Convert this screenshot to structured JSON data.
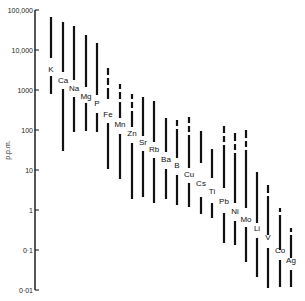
{
  "chart_data": {
    "type": "range-bar",
    "title": "",
    "xlabel": "",
    "ylabel": "p.p.m.",
    "yscale": "log",
    "ylim": [
      0.01,
      100000
    ],
    "yticks": [
      {
        "value": 100000,
        "label": "100,000"
      },
      {
        "value": 10000,
        "label": "10,000"
      },
      {
        "value": 1000,
        "label": "1000"
      },
      {
        "value": 100,
        "label": "100"
      },
      {
        "value": 10,
        "label": "10"
      },
      {
        "value": 1,
        "label": "1"
      },
      {
        "value": 0.1,
        "label": "0·1"
      },
      {
        "value": 0.01,
        "label": "0·01"
      }
    ],
    "grid": false,
    "legend": null,
    "categories": [
      "K",
      "Ca",
      "Na",
      "Mg",
      "P",
      "Fe",
      "Mn",
      "Zn",
      "Sr",
      "Rb",
      "Ba",
      "B",
      "Cu",
      "Cs",
      "Ti",
      "Pb",
      "Ni",
      "Mo",
      "Li",
      "V",
      "Co",
      "Ag"
    ],
    "series": [
      {
        "name": "K",
        "x": 51,
        "min": 700,
        "max": 60000,
        "label_y": 72,
        "segments": [
          [
            17,
            58
          ],
          [
            76,
            94
          ]
        ]
      },
      {
        "name": "Ca",
        "x": 63,
        "min": 30,
        "max": 50000,
        "label_y": 83,
        "segments": [
          [
            22,
            72
          ],
          [
            89,
            151
          ]
        ]
      },
      {
        "name": "Na",
        "x": 74,
        "min": 80,
        "max": 35000,
        "label_y": 91,
        "segments": [
          [
            26,
            80
          ],
          [
            97,
            132
          ]
        ]
      },
      {
        "name": "Mg",
        "x": 86,
        "min": 90,
        "max": 20000,
        "label_y": 99,
        "segments": [
          [
            35,
            87
          ],
          [
            103,
            131
          ]
        ]
      },
      {
        "name": "P",
        "x": 97,
        "min": 80,
        "max": 12000,
        "label_y": 106,
        "segments": [
          [
            43,
            95
          ],
          [
            113,
            132
          ]
        ]
      },
      {
        "name": "Fe",
        "x": 108,
        "min": 10,
        "max": 3000,
        "label_y": 117,
        "segments": [
          [
            68,
            75
          ],
          [
            78,
            85
          ],
          [
            88,
            99
          ],
          [
            123,
            169
          ]
        ]
      },
      {
        "name": "Mn",
        "x": 120,
        "min": 5,
        "max": 1500,
        "label_y": 127,
        "segments": [
          [
            84,
            89
          ],
          [
            92,
            99
          ],
          [
            102,
            118
          ],
          [
            134,
            179
          ]
        ]
      },
      {
        "name": "Zn",
        "x": 132,
        "min": 2,
        "max": 800,
        "label_y": 136,
        "segments": [
          [
            94,
            99
          ],
          [
            102,
            108
          ],
          [
            111,
            127
          ],
          [
            143,
            199
          ]
        ]
      },
      {
        "name": "Sr",
        "x": 143,
        "min": 2,
        "max": 600,
        "label_y": 145,
        "segments": [
          [
            97,
            136
          ],
          [
            151,
            197
          ]
        ]
      },
      {
        "name": "Rb",
        "x": 154,
        "min": 1,
        "max": 500,
        "label_y": 152,
        "segments": [
          [
            101,
            142
          ],
          [
            158,
            203
          ]
        ]
      },
      {
        "name": "Ba",
        "x": 166,
        "min": 2,
        "max": 250,
        "label_y": 162,
        "segments": [
          [
            118,
            152
          ],
          [
            169,
            199
          ]
        ]
      },
      {
        "name": "B",
        "x": 177,
        "min": 1,
        "max": 180,
        "label_y": 168,
        "segments": [
          [
            120,
            126
          ],
          [
            129,
            158
          ],
          [
            175,
            205
          ]
        ]
      },
      {
        "name": "Cu",
        "x": 189,
        "min": 1,
        "max": 150,
        "label_y": 177,
        "segments": [
          [
            117,
            123
          ],
          [
            126,
            132
          ],
          [
            135,
            168
          ],
          [
            183,
            207
          ]
        ]
      },
      {
        "name": "Cs",
        "x": 201,
        "min": 0.7,
        "max": 120,
        "label_y": 186,
        "segments": [
          [
            131,
            163
          ],
          [
            197,
            214
          ]
        ]
      },
      {
        "name": "Ti",
        "x": 212,
        "min": 0.6,
        "max": 60,
        "label_y": 194,
        "segments": [
          [
            149,
            178
          ],
          [
            203,
            218
          ]
        ]
      },
      {
        "name": "Pb",
        "x": 224,
        "min": 0.15,
        "max": 100,
        "label_y": 204,
        "segments": [
          [
            126,
            133
          ],
          [
            136,
            142
          ],
          [
            145,
            188
          ],
          [
            213,
            243
          ]
        ]
      },
      {
        "name": "Ni",
        "x": 235,
        "min": 0.1,
        "max": 100,
        "label_y": 214,
        "segments": [
          [
            133,
            141
          ],
          [
            144,
            150
          ],
          [
            153,
            203
          ],
          [
            221,
            245
          ]
        ]
      },
      {
        "name": "Mo",
        "x": 246,
        "min": 0.02,
        "max": 100,
        "label_y": 222,
        "segments": [
          [
            130,
            138
          ],
          [
            141,
            147
          ],
          [
            150,
            208
          ],
          [
            227,
            262
          ]
        ]
      },
      {
        "name": "Li",
        "x": 257,
        "min": 0.02,
        "max": 20,
        "label_y": 231,
        "segments": [
          [
            172,
            223
          ],
          [
            238,
            277
          ]
        ]
      },
      {
        "name": "V",
        "x": 268,
        "min": 0.01,
        "max": 10,
        "label_y": 240,
        "segments": [
          [
            185,
            193
          ],
          [
            196,
            235
          ],
          [
            248,
            288
          ]
        ]
      },
      {
        "name": "Co",
        "x": 280,
        "min": 0.01,
        "max": 5,
        "label_y": 253,
        "segments": [
          [
            208,
            212
          ],
          [
            215,
            250
          ],
          [
            260,
            287
          ]
        ]
      },
      {
        "name": "Ag",
        "x": 291,
        "min": 0.01,
        "max": 3,
        "label_y": 263,
        "segments": [
          [
            228,
            232
          ],
          [
            235,
            258
          ],
          [
            270,
            287
          ]
        ]
      }
    ]
  }
}
